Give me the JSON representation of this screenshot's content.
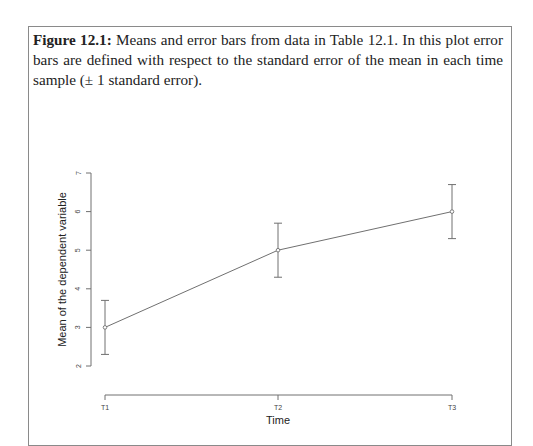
{
  "caption": {
    "label": "Figure 12.1:",
    "text": " Means and error bars from data in Table 12.1. In this plot error bars are defined with respect to the standard error of the mean in each time sample (± 1 standard error)."
  },
  "chart_data": {
    "type": "line",
    "title": "",
    "xlabel": "Time",
    "ylabel": "Mean of the dependent variable",
    "categories": [
      "T1",
      "T2",
      "T3"
    ],
    "series": [
      {
        "name": "Mean",
        "values": [
          3,
          5,
          6
        ],
        "error_lower": [
          2.3,
          4.3,
          5.3
        ],
        "error_upper": [
          3.7,
          5.7,
          6.7
        ]
      }
    ],
    "yticks": [
      2,
      3,
      4,
      5,
      6,
      7
    ],
    "ylim": [
      2,
      7
    ],
    "grid": false,
    "legend": "none",
    "error_bars": "± 1 standard error"
  },
  "colors": {
    "line": "#707070",
    "axis": "#707070",
    "frame": "#8a8a8a"
  }
}
